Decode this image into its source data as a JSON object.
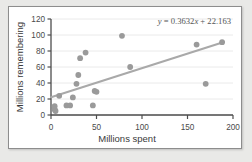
{
  "chart_data": {
    "type": "scatter",
    "title": "",
    "xlabel": "Millions spent",
    "ylabel": "Millions remembering",
    "xlim": [
      0,
      200
    ],
    "ylim": [
      0,
      120
    ],
    "xticks": [
      0,
      50,
      100,
      150,
      200
    ],
    "yticks": [
      0,
      20,
      40,
      60,
      80,
      100,
      120
    ],
    "grid": true,
    "grid_axis": "y",
    "legend": "none",
    "marker_color": "#9a9a9a",
    "trendline_color": "#a9a9a9",
    "annotation": "y = 0.3632x + 22.163",
    "trendline": {
      "slope": 0.3632,
      "intercept": 22.163,
      "x_start": 0,
      "x_end": 190
    },
    "points": [
      {
        "x": 4,
        "y": 11
      },
      {
        "x": 4,
        "y": 7
      },
      {
        "x": 5,
        "y": 5
      },
      {
        "x": 9,
        "y": 24
      },
      {
        "x": 17,
        "y": 12
      },
      {
        "x": 21,
        "y": 12
      },
      {
        "x": 24,
        "y": 22
      },
      {
        "x": 28,
        "y": 39
      },
      {
        "x": 30,
        "y": 50
      },
      {
        "x": 32,
        "y": 71
      },
      {
        "x": 38,
        "y": 78
      },
      {
        "x": 46,
        "y": 12
      },
      {
        "x": 48,
        "y": 30
      },
      {
        "x": 50,
        "y": 29
      },
      {
        "x": 78,
        "y": 99
      },
      {
        "x": 87,
        "y": 60
      },
      {
        "x": 160,
        "y": 88
      },
      {
        "x": 170,
        "y": 39
      },
      {
        "x": 188,
        "y": 91
      }
    ]
  },
  "tick_labels": {
    "x": [
      "0",
      "50",
      "100",
      "150",
      "200"
    ],
    "y": [
      "0",
      "20",
      "40",
      "60",
      "80",
      "100",
      "120"
    ]
  }
}
